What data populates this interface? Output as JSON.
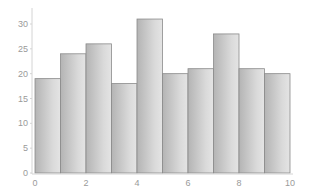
{
  "chart_data": {
    "type": "bar",
    "title": "",
    "xlabel": "",
    "ylabel": "",
    "bins": [
      {
        "x0": 0,
        "x1": 1,
        "value": 19
      },
      {
        "x0": 1,
        "x1": 2,
        "value": 24
      },
      {
        "x0": 2,
        "x1": 3,
        "value": 26
      },
      {
        "x0": 3,
        "x1": 4,
        "value": 18
      },
      {
        "x0": 4,
        "x1": 5,
        "value": 31
      },
      {
        "x0": 5,
        "x1": 6,
        "value": 20
      },
      {
        "x0": 6,
        "x1": 7,
        "value": 21
      },
      {
        "x0": 7,
        "x1": 8,
        "value": 28
      },
      {
        "x0": 8,
        "x1": 9,
        "value": 21
      },
      {
        "x0": 9,
        "x1": 10,
        "value": 20
      }
    ],
    "categories": [
      "0-1",
      "1-2",
      "2-3",
      "3-4",
      "4-5",
      "5-6",
      "6-7",
      "7-8",
      "8-9",
      "9-10"
    ],
    "values": [
      19,
      24,
      26,
      18,
      31,
      20,
      21,
      28,
      21,
      20
    ],
    "xlim": [
      0,
      10
    ],
    "ylim": [
      0,
      33
    ],
    "x_ticks": [
      0,
      2,
      4,
      6,
      8,
      10
    ],
    "y_ticks": [
      0,
      5,
      10,
      15,
      20,
      25,
      30
    ],
    "grid": false,
    "legend": null,
    "colors": {
      "bar_dark": "#b4b4b4",
      "bar_light": "#e2e2e2",
      "bar_edge": "#8a8a8a",
      "axis": "#d4d4d4",
      "tick_text": "#9a9a9a"
    }
  }
}
